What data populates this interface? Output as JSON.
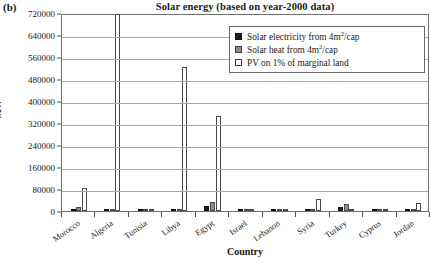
{
  "panel_label": "(b)",
  "axis": {
    "y_title": "MW",
    "x_title": "Country"
  },
  "legend": {
    "items": [
      {
        "label_pre": "Solar electricity from 4m",
        "sup": "2",
        "label_post": "/cap",
        "swatch": "s0"
      },
      {
        "label_pre": "Solar heat from 4m",
        "sup": "2",
        "label_post": "/cap",
        "swatch": "s1"
      },
      {
        "label_pre": "PV on 1% of marginal land",
        "sup": "",
        "label_post": "",
        "swatch": "s2"
      }
    ]
  },
  "chart_data": {
    "type": "bar",
    "title": "Solar energy (based on year-2000 data)",
    "xlabel": "Country",
    "ylabel": "MW",
    "ylim": [
      0,
      720000
    ],
    "ytick_step": 80000,
    "yticks": [
      720000,
      640000,
      560000,
      480000,
      400000,
      320000,
      240000,
      160000,
      80000,
      0
    ],
    "ytick_labels": [
      "720000",
      "640000",
      "560000",
      "480000",
      "400000",
      "320000",
      "240000",
      "160000",
      "80000",
      "0"
    ],
    "grid": true,
    "legend_position": "top-right",
    "categories": [
      "Morocco",
      "Algeria",
      "Tunisia",
      "Libya",
      "Egypt",
      "Israel",
      "Lebanon",
      "Syria",
      "Turkey",
      "Cyprus",
      "Jordan"
    ],
    "series": [
      {
        "name": "Solar electricity from 4m2/cap",
        "color": "#1c1c1c",
        "values": [
          4000,
          3000,
          2000,
          1000,
          18000,
          1000,
          800,
          3000,
          16000,
          200,
          1200
        ]
      },
      {
        "name": "Solar heat from 4m2/cap",
        "color": "#8d8d8d",
        "values": [
          13000,
          9000,
          6000,
          3000,
          31000,
          2500,
          2000,
          8000,
          24000,
          500,
          3000
        ]
      },
      {
        "name": "PV on 1% of marginal land",
        "color": "#ffffff",
        "values": [
          85000,
          715000,
          2000,
          525000,
          345000,
          3000,
          500,
          45000,
          6000,
          300,
          28000
        ]
      }
    ]
  }
}
